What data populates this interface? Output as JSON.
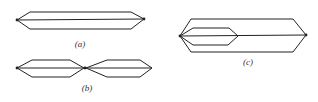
{
  "diagram": {
    "stroke_color": "#222222",
    "background": "#ffffff",
    "figures": [
      {
        "id": "a",
        "label": "(a)",
        "label_pos": [
          80,
          44
        ],
        "description": "single elongated hexagon split by a horizontal axis line",
        "polygons": [
          [
            [
              17,
              20
            ],
            [
              30,
              12
            ],
            [
              131,
              12
            ],
            [
              144,
              19
            ],
            [
              131,
              29
            ],
            [
              30,
              29
            ]
          ]
        ],
        "lines": [
          [
            [
              17,
              20
            ],
            [
              144,
              19
            ]
          ]
        ],
        "dots": [
          [
            17,
            20
          ],
          [
            144,
            19
          ]
        ]
      },
      {
        "id": "b",
        "label": "(b)",
        "label_pos": [
          87,
          88
        ],
        "description": "two hexagons joined tip to tip, each split by a horizontal axis line",
        "polygons": [
          [
            [
              17,
              68
            ],
            [
              32,
              60
            ],
            [
              70,
              60
            ],
            [
              84,
              68
            ],
            [
              70,
              77
            ],
            [
              32,
              77
            ]
          ],
          [
            [
              86,
              68
            ],
            [
              107,
              60
            ],
            [
              140,
              60
            ],
            [
              152,
              68
            ],
            [
              140,
              77
            ],
            [
              107,
              77
            ]
          ]
        ],
        "lines": [
          [
            [
              17,
              68
            ],
            [
              84,
              68
            ]
          ],
          [
            [
              86,
              68
            ],
            [
              152,
              68
            ]
          ]
        ],
        "dots": [
          [
            17,
            68
          ],
          [
            85,
            68
          ]
        ]
      },
      {
        "id": "c",
        "label": "(c)",
        "label_pos": [
          248,
          62
        ],
        "description": "large hexagon containing a smaller hexagon sharing the left tip, with a shared horizontal axis line",
        "polygons": [
          [
            [
              180,
              36
            ],
            [
              191,
              19
            ],
            [
              293,
              19
            ],
            [
              306,
              35
            ],
            [
              293,
              52
            ],
            [
              191,
              52
            ]
          ],
          [
            [
              180,
              36
            ],
            [
              193,
              28
            ],
            [
              229,
              28
            ],
            [
              238,
              36
            ],
            [
              228,
              45
            ],
            [
              193,
              45
            ]
          ]
        ],
        "lines": [
          [
            [
              180,
              36
            ],
            [
              306,
              35
            ]
          ]
        ],
        "dots": [
          [
            180,
            36
          ],
          [
            306,
            35
          ]
        ]
      }
    ]
  }
}
